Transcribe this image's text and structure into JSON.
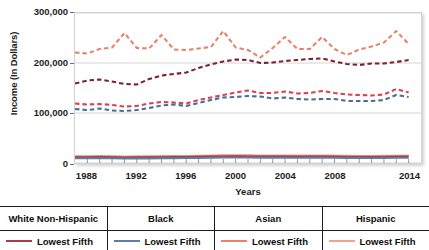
{
  "chart_data": {
    "type": "line",
    "title": "",
    "xlabel": "Years",
    "ylabel": "Income (In Dollars)",
    "xlim": [
      1987,
      2015
    ],
    "ylim": [
      0,
      300000
    ],
    "xticks": [
      1988,
      1992,
      1996,
      2000,
      2004,
      2008,
      2014
    ],
    "xtick_labels": [
      "1988",
      "1992",
      "1996",
      "2000",
      "2004",
      "2008",
      "2014"
    ],
    "yticks": [
      0,
      100000,
      200000,
      300000
    ],
    "ytick_labels": [
      "0",
      "100,000",
      "200,000",
      "300,000"
    ],
    "grid": true,
    "legend_position": "bottom",
    "x": [
      1987,
      1988,
      1989,
      1990,
      1991,
      1992,
      1993,
      1994,
      1995,
      1996,
      1997,
      1998,
      1999,
      2000,
      2001,
      2002,
      2003,
      2004,
      2005,
      2006,
      2007,
      2008,
      2009,
      2010,
      2011,
      2012,
      2013,
      2014
    ],
    "series": [
      {
        "name": "Asian Highest Fifth",
        "group": "Asian",
        "quintile": "Highest Fifth",
        "color": "#e8836a",
        "dash": "dashed",
        "values": [
          221000,
          219000,
          228000,
          231000,
          260000,
          230000,
          229000,
          256000,
          227000,
          226000,
          229000,
          232000,
          264000,
          231000,
          226000,
          211000,
          230000,
          252000,
          228000,
          228000,
          252000,
          228000,
          216000,
          227000,
          233000,
          241000,
          264000,
          238000
        ]
      },
      {
        "name": "White Non-Hispanic Highest Fifth",
        "group": "White Non-Hispanic",
        "quintile": "Highest Fifth",
        "color": "#7a2230",
        "dash": "dashed",
        "values": [
          159000,
          165000,
          167000,
          163000,
          158000,
          157000,
          168000,
          175000,
          178000,
          181000,
          190000,
          197000,
          203000,
          207000,
          206000,
          200000,
          201000,
          204000,
          206000,
          208000,
          209000,
          203000,
          198000,
          196000,
          199000,
          199000,
          202000,
          206000
        ]
      },
      {
        "name": "Hispanic Highest Fifth",
        "group": "Hispanic",
        "quintile": "Highest Fifth",
        "color": "#d9414f",
        "dash": "dashed",
        "values": [
          119000,
          117000,
          118000,
          116000,
          113000,
          114000,
          119000,
          122000,
          121000,
          119000,
          126000,
          131000,
          136000,
          141000,
          145000,
          140000,
          140000,
          143000,
          139000,
          140000,
          144000,
          140000,
          137000,
          136000,
          135000,
          137000,
          148000,
          141000
        ]
      },
      {
        "name": "Black Highest Fifth",
        "group": "Black",
        "quintile": "Highest Fifth",
        "color": "#4a6e93",
        "dash": "dashed",
        "values": [
          108000,
          106000,
          109000,
          105000,
          104000,
          106000,
          110000,
          115000,
          117000,
          114000,
          120000,
          126000,
          131000,
          132000,
          134000,
          133000,
          129000,
          131000,
          128000,
          127000,
          128000,
          128000,
          124000,
          124000,
          124000,
          126000,
          136000,
          132000
        ]
      },
      {
        "name": "Hispanic Lowest Fifth",
        "group": "Hispanic",
        "quintile": "Lowest Fifth",
        "color": "#f0a393",
        "dash": "solid",
        "values": [
          13500,
          13800,
          14000,
          13600,
          13300,
          13200,
          13400,
          13700,
          14000,
          14200,
          14800,
          15200,
          15500,
          15700,
          15500,
          15200,
          15000,
          15100,
          15000,
          15200,
          15300,
          14900,
          14400,
          14300,
          14200,
          14400,
          14800,
          15000
        ]
      },
      {
        "name": "Asian Lowest Fifth",
        "group": "Asian",
        "quintile": "Lowest Fifth",
        "color": "#e8836a",
        "dash": "solid",
        "values": [
          12500,
          12700,
          12900,
          12600,
          12300,
          12400,
          12600,
          12900,
          13100,
          13200,
          13700,
          14100,
          14400,
          14600,
          14400,
          14100,
          14000,
          14100,
          14000,
          14100,
          14300,
          13900,
          13500,
          13400,
          13300,
          13500,
          13900,
          14000
        ]
      },
      {
        "name": "White Non-Hispanic Lowest Fifth",
        "group": "White Non-Hispanic",
        "quintile": "Lowest Fifth",
        "color": "#a83c4c",
        "dash": "solid",
        "values": [
          11500,
          11700,
          11900,
          11600,
          11300,
          11400,
          11500,
          11800,
          12000,
          12100,
          12500,
          12900,
          13200,
          13400,
          13200,
          13000,
          12900,
          12900,
          12800,
          12900,
          13000,
          12700,
          12300,
          12200,
          12100,
          12300,
          12700,
          12800
        ]
      },
      {
        "name": "Black Lowest Fifth",
        "group": "Black",
        "quintile": "Lowest Fifth",
        "color": "#5b7fa6",
        "dash": "solid",
        "values": [
          9200,
          9300,
          9500,
          9200,
          9000,
          9000,
          9100,
          9400,
          9600,
          9700,
          10100,
          10400,
          10700,
          10800,
          10700,
          10500,
          10400,
          10400,
          10300,
          10400,
          10500,
          10200,
          9900,
          9800,
          9700,
          9900,
          10200,
          10300
        ]
      }
    ]
  },
  "legend": {
    "columns": [
      {
        "header": "White Non-Hispanic",
        "entries": [
          {
            "label": "Lowest Fifth",
            "color": "#a83c4c"
          }
        ]
      },
      {
        "header": "Black",
        "entries": [
          {
            "label": "Lowest Fifth",
            "color": "#5b7fa6"
          }
        ]
      },
      {
        "header": "Asian",
        "entries": [
          {
            "label": "Lowest Fifth",
            "color": "#e8836a"
          }
        ]
      },
      {
        "header": "Hispanic",
        "entries": [
          {
            "label": "Lowest Fifth",
            "color": "#f0a393"
          }
        ]
      }
    ]
  }
}
